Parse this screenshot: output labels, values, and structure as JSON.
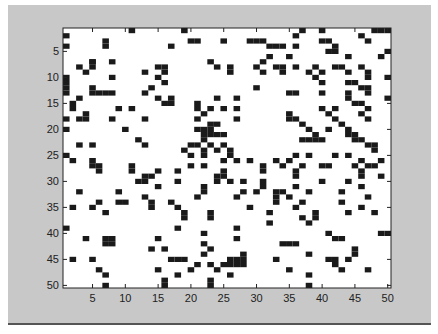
{
  "window": {
    "background_color": "#c8c8c8",
    "axes_background": "#ffffff",
    "cell_color": "#1a1a1a"
  },
  "chart_data": {
    "type": "heatmap",
    "title": "",
    "xlabel": "",
    "ylabel": "",
    "rows": 50,
    "cols": 50,
    "xlim": [
      0.5,
      50.5
    ],
    "ylim": [
      0.5,
      50.5
    ],
    "y_reversed": true,
    "grid": false,
    "colormap": {
      "0": "#ffffff",
      "1": "#1a1a1a"
    },
    "x_ticks": [
      5,
      10,
      15,
      20,
      25,
      30,
      35,
      40,
      45,
      50
    ],
    "x_tick_labels": [
      "5",
      "10",
      "15",
      "20",
      "25",
      "30",
      "35",
      "40",
      "45",
      "50"
    ],
    "y_ticks": [
      5,
      10,
      15,
      20,
      25,
      30,
      35,
      40,
      45,
      50
    ],
    "y_tick_labels": [
      "5",
      "10",
      "15",
      "20",
      "25",
      "30",
      "35",
      "40",
      "45",
      "50"
    ],
    "filled_cells": [
      [
        1,
        11
      ],
      [
        1,
        19
      ],
      [
        1,
        37
      ],
      [
        1,
        40
      ],
      [
        1,
        48
      ],
      [
        1,
        49
      ],
      [
        1,
        50
      ],
      [
        2,
        1
      ],
      [
        2,
        36
      ],
      [
        2,
        46
      ],
      [
        3,
        7
      ],
      [
        3,
        25
      ],
      [
        3,
        31
      ],
      [
        3,
        20
      ],
      [
        3,
        21
      ],
      [
        3,
        29
      ],
      [
        3,
        30
      ],
      [
        3,
        41
      ],
      [
        3,
        40
      ],
      [
        3,
        47
      ],
      [
        4,
        1
      ],
      [
        4,
        7
      ],
      [
        4,
        17
      ],
      [
        4,
        32
      ],
      [
        4,
        33
      ],
      [
        4,
        34
      ],
      [
        4,
        36
      ],
      [
        4,
        42
      ],
      [
        5,
        42
      ],
      [
        5,
        41
      ],
      [
        5,
        50
      ],
      [
        6,
        44
      ],
      [
        6,
        32
      ],
      [
        6,
        35
      ],
      [
        6,
        49
      ],
      [
        7,
        5
      ],
      [
        7,
        5
      ],
      [
        7,
        8
      ],
      [
        7,
        23
      ],
      [
        7,
        31
      ],
      [
        8,
        3
      ],
      [
        8,
        5
      ],
      [
        8,
        15
      ],
      [
        8,
        16
      ],
      [
        8,
        24
      ],
      [
        8,
        26
      ],
      [
        8,
        30
      ],
      [
        8,
        33
      ],
      [
        8,
        34
      ],
      [
        8,
        36
      ],
      [
        8,
        39
      ],
      [
        8,
        42
      ],
      [
        8,
        43
      ],
      [
        8,
        46
      ],
      [
        9,
        4
      ],
      [
        9,
        13
      ],
      [
        9,
        16
      ],
      [
        9,
        26
      ],
      [
        9,
        31
      ],
      [
        9,
        34
      ],
      [
        9,
        38
      ],
      [
        9,
        40
      ],
      [
        9,
        44
      ],
      [
        9,
        47
      ],
      [
        10,
        1
      ],
      [
        10,
        8
      ],
      [
        10,
        15
      ],
      [
        10,
        39
      ],
      [
        10,
        47
      ],
      [
        10,
        50
      ],
      [
        11,
        1
      ],
      [
        11,
        16
      ],
      [
        11,
        44
      ],
      [
        11,
        45
      ],
      [
        11,
        40
      ],
      [
        12,
        1
      ],
      [
        12,
        5
      ],
      [
        12,
        14
      ],
      [
        12,
        30
      ],
      [
        12,
        46
      ],
      [
        12,
        47
      ],
      [
        13,
        1
      ],
      [
        13,
        5
      ],
      [
        13,
        6
      ],
      [
        13,
        7
      ],
      [
        13,
        8
      ],
      [
        13,
        13
      ],
      [
        13,
        40
      ],
      [
        13,
        35
      ],
      [
        13,
        36
      ],
      [
        13,
        44
      ],
      [
        13,
        47
      ],
      [
        14,
        3
      ],
      [
        14,
        15
      ],
      [
        14,
        17
      ],
      [
        14,
        24
      ],
      [
        14,
        27
      ],
      [
        14,
        44
      ],
      [
        14,
        50
      ],
      [
        15,
        2
      ],
      [
        15,
        16
      ],
      [
        15,
        17
      ],
      [
        15,
        21
      ],
      [
        15,
        45
      ],
      [
        15,
        46
      ],
      [
        16,
        2
      ],
      [
        16,
        9
      ],
      [
        16,
        11
      ],
      [
        16,
        21
      ],
      [
        16,
        23
      ],
      [
        16,
        25
      ],
      [
        16,
        27
      ],
      [
        16,
        40
      ],
      [
        16,
        42
      ],
      [
        16,
        47
      ],
      [
        17,
        4
      ],
      [
        17,
        22
      ],
      [
        17,
        41
      ],
      [
        17,
        35
      ],
      [
        17,
        46
      ],
      [
        18,
        1
      ],
      [
        18,
        3
      ],
      [
        18,
        4
      ],
      [
        18,
        8
      ],
      [
        18,
        13
      ],
      [
        18,
        21
      ],
      [
        18,
        27
      ],
      [
        18,
        35
      ],
      [
        18,
        36
      ],
      [
        18,
        42
      ],
      [
        18,
        47
      ],
      [
        19,
        37
      ],
      [
        19,
        43
      ],
      [
        19,
        23
      ],
      [
        19,
        24
      ],
      [
        20,
        1
      ],
      [
        20,
        10
      ],
      [
        20,
        21
      ],
      [
        20,
        22
      ],
      [
        20,
        23
      ],
      [
        20,
        38
      ],
      [
        20,
        41
      ],
      [
        20,
        44
      ],
      [
        21,
        22
      ],
      [
        21,
        23
      ],
      [
        21,
        24
      ],
      [
        21,
        25
      ],
      [
        21,
        39
      ],
      [
        21,
        44
      ],
      [
        21,
        45
      ],
      [
        22,
        12
      ],
      [
        22,
        22
      ],
      [
        22,
        37
      ],
      [
        22,
        38
      ],
      [
        22,
        39
      ],
      [
        22,
        40
      ],
      [
        22,
        45
      ],
      [
        22,
        46
      ],
      [
        23,
        3
      ],
      [
        23,
        5
      ],
      [
        23,
        13
      ],
      [
        23,
        20
      ],
      [
        23,
        21
      ],
      [
        23,
        23
      ],
      [
        23,
        25
      ],
      [
        23,
        47
      ],
      [
        23,
        48
      ],
      [
        24,
        19
      ],
      [
        24,
        22
      ],
      [
        24,
        24
      ],
      [
        24,
        26
      ],
      [
        24,
        48
      ],
      [
        25,
        1
      ],
      [
        25,
        20
      ],
      [
        25,
        22
      ],
      [
        25,
        26
      ],
      [
        25,
        36
      ],
      [
        25,
        38
      ],
      [
        25,
        42
      ],
      [
        25,
        44
      ],
      [
        26,
        2
      ],
      [
        26,
        5
      ],
      [
        26,
        25
      ],
      [
        26,
        27
      ],
      [
        26,
        29
      ],
      [
        26,
        33
      ],
      [
        26,
        35
      ],
      [
        26,
        46
      ],
      [
        26,
        49
      ],
      [
        27,
        5
      ],
      [
        27,
        6
      ],
      [
        27,
        11
      ],
      [
        27,
        20
      ],
      [
        27,
        22
      ],
      [
        27,
        31
      ],
      [
        27,
        34
      ],
      [
        27,
        37
      ],
      [
        27,
        40
      ],
      [
        27,
        41
      ],
      [
        27,
        45
      ],
      [
        27,
        47
      ],
      [
        27,
        48
      ],
      [
        28,
        6
      ],
      [
        28,
        11
      ],
      [
        28,
        15
      ],
      [
        28,
        18
      ],
      [
        28,
        25
      ],
      [
        28,
        31
      ],
      [
        28,
        36
      ],
      [
        28,
        46
      ],
      [
        29,
        13
      ],
      [
        29,
        14
      ],
      [
        29,
        24
      ],
      [
        29,
        25
      ],
      [
        29,
        36
      ],
      [
        29,
        46
      ],
      [
        29,
        49
      ],
      [
        30,
        12
      ],
      [
        30,
        13
      ],
      [
        30,
        18
      ],
      [
        30,
        24
      ],
      [
        30,
        26
      ],
      [
        30,
        28
      ],
      [
        30,
        31
      ],
      [
        30,
        40
      ],
      [
        30,
        44
      ],
      [
        31,
        15
      ],
      [
        31,
        22
      ],
      [
        31,
        31
      ],
      [
        31,
        36
      ],
      [
        31,
        46
      ],
      [
        32,
        3
      ],
      [
        32,
        9
      ],
      [
        32,
        22
      ],
      [
        32,
        28
      ],
      [
        32,
        30
      ],
      [
        32,
        33
      ],
      [
        32,
        34
      ],
      [
        32,
        38
      ],
      [
        32,
        43
      ],
      [
        33,
        13
      ],
      [
        33,
        21
      ],
      [
        33,
        27
      ],
      [
        33,
        33
      ],
      [
        33,
        35
      ],
      [
        33,
        47
      ],
      [
        34,
        6
      ],
      [
        34,
        9
      ],
      [
        34,
        10
      ],
      [
        34,
        14
      ],
      [
        34,
        17
      ],
      [
        34,
        33
      ],
      [
        34,
        37
      ],
      [
        34,
        43
      ],
      [
        35,
        2
      ],
      [
        35,
        5
      ],
      [
        35,
        14
      ],
      [
        35,
        18
      ],
      [
        35,
        29
      ],
      [
        35,
        36
      ],
      [
        35,
        46
      ],
      [
        36,
        7
      ],
      [
        36,
        19
      ],
      [
        36,
        23
      ],
      [
        36,
        32
      ],
      [
        36,
        39
      ],
      [
        36,
        44
      ],
      [
        36,
        48
      ],
      [
        37,
        19
      ],
      [
        37,
        23
      ],
      [
        37,
        37
      ],
      [
        37,
        39
      ],
      [
        38,
        32
      ],
      [
        38,
        38
      ],
      [
        39,
        1
      ],
      [
        39,
        18
      ],
      [
        39,
        27
      ],
      [
        40,
        22
      ],
      [
        40,
        41
      ],
      [
        40,
        49
      ],
      [
        40,
        50
      ],
      [
        41,
        4
      ],
      [
        41,
        7
      ],
      [
        41,
        8
      ],
      [
        41,
        15
      ],
      [
        41,
        27
      ],
      [
        41,
        42
      ],
      [
        41,
        43
      ],
      [
        42,
        7
      ],
      [
        42,
        8
      ],
      [
        42,
        22
      ],
      [
        42,
        34
      ],
      [
        42,
        35
      ],
      [
        42,
        36
      ],
      [
        43,
        14
      ],
      [
        43,
        16
      ],
      [
        43,
        23
      ],
      [
        43,
        45
      ],
      [
        44,
        22
      ],
      [
        44,
        28
      ],
      [
        44,
        38
      ],
      [
        44,
        45
      ],
      [
        45,
        2
      ],
      [
        45,
        5
      ],
      [
        45,
        17
      ],
      [
        45,
        18
      ],
      [
        45,
        19
      ],
      [
        45,
        26
      ],
      [
        45,
        27
      ],
      [
        45,
        28
      ],
      [
        45,
        33
      ],
      [
        45,
        41
      ],
      [
        45,
        42
      ],
      [
        45,
        44
      ],
      [
        46,
        21
      ],
      [
        46,
        23
      ],
      [
        46,
        25
      ],
      [
        46,
        26
      ],
      [
        46,
        27
      ],
      [
        46,
        28
      ],
      [
        46,
        42
      ],
      [
        47,
        6
      ],
      [
        47,
        15
      ],
      [
        47,
        20
      ],
      [
        47,
        24
      ],
      [
        47,
        35
      ],
      [
        47,
        43
      ],
      [
        47,
        47
      ],
      [
        48,
        7
      ],
      [
        48,
        18
      ],
      [
        48,
        26
      ],
      [
        48,
        38
      ],
      [
        49,
        23
      ],
      [
        49,
        16
      ],
      [
        50,
        7
      ],
      [
        50,
        16
      ],
      [
        50,
        23
      ],
      [
        50,
        38
      ]
    ]
  }
}
